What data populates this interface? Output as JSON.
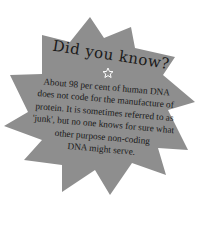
{
  "callout": {
    "title": "Did you know?",
    "icon": "star-outline-icon",
    "lines": [
      "About 98 per cent of human DNA",
      "does not code for the manufacture of",
      "protein. It is sometimes referred to as",
      "'junk', but no one knows for sure what",
      "other purpose non-coding",
      "DNA might serve."
    ],
    "colors": {
      "burst_fill": "#8e8e8e",
      "text": "#1a1a1a",
      "background": "#ffffff"
    }
  }
}
